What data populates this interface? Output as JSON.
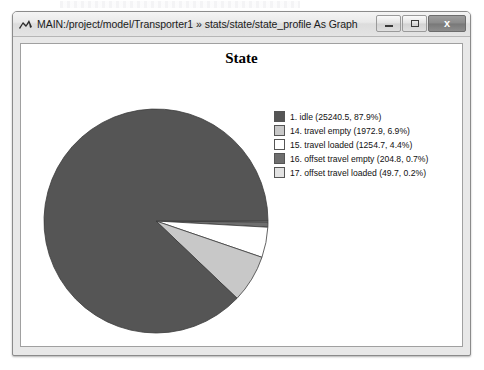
{
  "window": {
    "title": "MAIN:/project/model/Transporter1 » stats/state/state_profile As Graph",
    "icon": "chart-peak-icon",
    "buttons": {
      "minimize": "—",
      "maximize": "□",
      "close": "x"
    }
  },
  "chart_data": {
    "type": "pie",
    "title": "State",
    "xlabel": "",
    "ylabel": "",
    "legend_position": "right",
    "grid": false,
    "start_angle_deg": 0,
    "direction": "clockwise",
    "categories": [
      "1. idle",
      "14. travel empty",
      "15. travel loaded",
      "16. offset travel empty",
      "17. offset travel loaded"
    ],
    "values": [
      25240.5,
      1972.9,
      1254.7,
      204.8,
      49.7
    ],
    "percentages": [
      87.9,
      6.9,
      4.4,
      0.7,
      0.2
    ],
    "colors": [
      "#555555",
      "#c8c8c8",
      "#ffffff",
      "#6e6e6e",
      "#e2e2e2"
    ],
    "legend_labels": [
      "1. idle (25240.5, 87.9%)",
      "14. travel empty (1972.9, 6.9%)",
      "15. travel loaded (1254.7, 4.4%)",
      "16. offset travel empty (204.8, 0.7%)",
      "17. offset travel loaded (49.7, 0.2%)"
    ],
    "slices": [
      {
        "label": "1. idle",
        "value": 25240.5,
        "percent": 87.9,
        "color": "#555555"
      },
      {
        "label": "14. travel empty",
        "value": 1972.9,
        "percent": 6.9,
        "color": "#c8c8c8"
      },
      {
        "label": "15. travel loaded",
        "value": 1254.7,
        "percent": 4.4,
        "color": "#ffffff"
      },
      {
        "label": "16. offset travel empty",
        "value": 204.8,
        "percent": 0.7,
        "color": "#6e6e6e"
      },
      {
        "label": "17. offset travel loaded",
        "value": 49.7,
        "percent": 0.2,
        "color": "#e2e2e2"
      }
    ]
  }
}
